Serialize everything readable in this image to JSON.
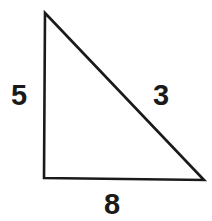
{
  "figure": {
    "type": "right-triangle-diagram",
    "background_color": "#ffffff",
    "stroke_color": "#1a1a1a",
    "stroke_width": 2.6,
    "label_color": "#1a1a1a",
    "vertices": {
      "apex": [
        45,
        13
      ],
      "bottom_left": [
        44,
        178
      ],
      "bottom_right": [
        204,
        180
      ]
    },
    "labels": {
      "vertical_leg": "5",
      "hypotenuse": "3",
      "horizontal_leg": "8"
    },
    "side_label_positions": {
      "vertical_leg": [
        19,
        95
      ],
      "hypotenuse": [
        161,
        95
      ],
      "horizontal_leg": [
        112,
        204
      ]
    }
  },
  "chart_data": {
    "type": "diagram",
    "title": "",
    "shape": "triangle",
    "sides": [
      {
        "name": "vertical-leg",
        "label": "5",
        "from": [
          45,
          13
        ],
        "to": [
          44,
          178
        ]
      },
      {
        "name": "hypotenuse",
        "label": "3",
        "from": [
          45,
          13
        ],
        "to": [
          204,
          180
        ]
      },
      {
        "name": "horizontal-leg",
        "label": "8",
        "from": [
          44,
          178
        ],
        "to": [
          204,
          180
        ]
      }
    ],
    "values": [
      5,
      3,
      8
    ],
    "categories": [
      "vertical-leg",
      "hypotenuse",
      "horizontal-leg"
    ]
  }
}
